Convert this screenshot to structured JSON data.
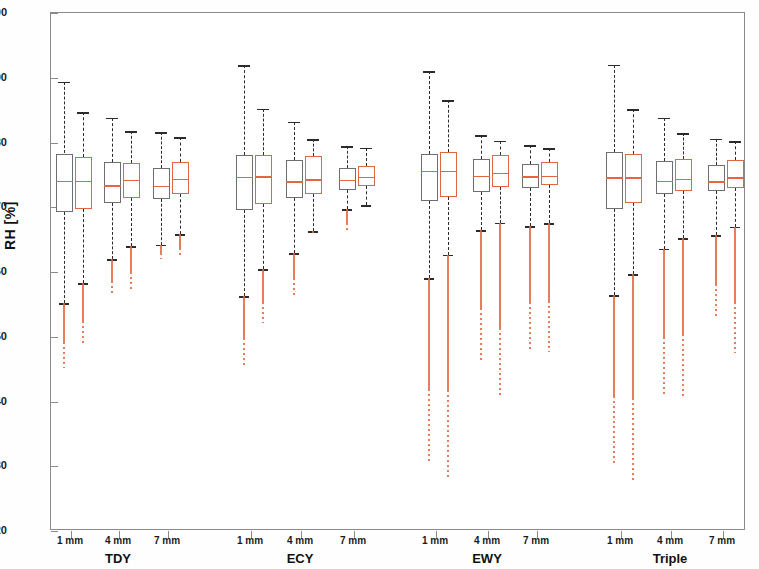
{
  "axes": {
    "ylabel": "RH [%]",
    "ylim": [
      20,
      100
    ],
    "yticks": [
      20,
      30,
      40,
      50,
      60,
      70,
      80,
      90,
      100
    ],
    "ytick_labels": [
      "20",
      "30",
      "40",
      "50",
      "60",
      "70",
      "80",
      "90",
      "100"
    ],
    "grid": false
  },
  "colors": {
    "series_a": "#6b6f73",
    "series_b": "#e2663f",
    "axis": "#8a8a8a",
    "text": "#1a1a1a",
    "background": "#ffffff"
  },
  "groups": [
    {
      "label": "TDY",
      "center": 118
    },
    {
      "label": "ECY",
      "center": 300
    },
    {
      "label": "EWY",
      "center": 487
    },
    {
      "label": "Triple",
      "center": 670
    }
  ],
  "xticks": [
    {
      "label": "1 mm",
      "x": 70
    },
    {
      "label": "4 mm",
      "x": 118
    },
    {
      "label": "7 mm",
      "x": 167
    },
    {
      "label": "1 mm",
      "x": 250
    },
    {
      "label": "4 mm",
      "x": 300
    },
    {
      "label": "7 mm",
      "x": 353
    },
    {
      "label": "1 mm",
      "x": 435
    },
    {
      "label": "4 mm",
      "x": 487
    },
    {
      "label": "7 mm",
      "x": 536
    },
    {
      "label": "1 mm",
      "x": 620
    },
    {
      "label": "4 mm",
      "x": 670
    },
    {
      "label": "7 mm",
      "x": 722
    }
  ],
  "chart_data": {
    "type": "box",
    "title": "",
    "xlabel": "",
    "ylabel": "RH [%]",
    "ylim": [
      20,
      100
    ],
    "yticks": [
      20,
      30,
      40,
      50,
      60,
      70,
      80,
      90,
      100
    ],
    "categories": [
      "TDY 1 mm",
      "TDY 4 mm",
      "TDY 7 mm",
      "ECY 1 mm",
      "ECY 4 mm",
      "ECY 7 mm",
      "EWY 1 mm",
      "EWY 4 mm",
      "EWY 7 mm",
      "Triple 1 mm",
      "Triple 4 mm",
      "Triple 7 mm"
    ],
    "series": [
      {
        "name": "series_a",
        "color": "#6b6f73",
        "style": "gray box, black dashed whiskers",
        "boxes": [
          {
            "category": "TDY 1 mm",
            "x": 63,
            "q1": 69.3,
            "median": 74.1,
            "q3": 78.3,
            "whisker_low": 55.2,
            "whisker_high": 89.4,
            "tail_min": 45.2
          },
          {
            "category": "TDY 4 mm",
            "x": 111,
            "q1": 70.7,
            "median": 73.4,
            "q3": 77.0,
            "whisker_low": 62.0,
            "whisker_high": 83.8,
            "tail_min": 56.4
          },
          {
            "category": "TDY 7 mm",
            "x": 160,
            "q1": 71.3,
            "median": 73.3,
            "q3": 76.1,
            "whisker_low": 64.2,
            "whisker_high": 81.6,
            "tail_min": 62.0
          },
          {
            "category": "ECY 1 mm",
            "x": 243,
            "q1": 69.6,
            "median": 74.7,
            "q3": 78.1,
            "whisker_low": 56.3,
            "whisker_high": 91.9,
            "tail_min": 45.5
          },
          {
            "category": "ECY 4 mm",
            "x": 293,
            "q1": 71.4,
            "median": 74.0,
            "q3": 77.3,
            "whisker_low": 62.9,
            "whisker_high": 83.2,
            "tail_min": 56.4
          },
          {
            "category": "ECY 7 mm",
            "x": 346,
            "q1": 72.7,
            "median": 74.2,
            "q3": 76.0,
            "whisker_low": 69.7,
            "whisker_high": 79.4,
            "tail_min": 66.1
          },
          {
            "category": "EWY 1 mm",
            "x": 428,
            "q1": 70.9,
            "median": 75.6,
            "q3": 78.2,
            "whisker_low": 59.0,
            "whisker_high": 91.0,
            "tail_min": 30.6
          },
          {
            "category": "EWY 4 mm",
            "x": 480,
            "q1": 72.4,
            "median": 74.9,
            "q3": 77.4,
            "whisker_low": 66.5,
            "whisker_high": 81.1,
            "tail_min": 46.3
          },
          {
            "category": "EWY 7 mm",
            "x": 529,
            "q1": 73.0,
            "median": 74.8,
            "q3": 76.7,
            "whisker_low": 67.1,
            "whisker_high": 79.6,
            "tail_min": 47.6
          },
          {
            "category": "Triple 1 mm",
            "x": 613,
            "q1": 69.8,
            "median": 74.6,
            "q3": 78.5,
            "whisker_low": 56.4,
            "whisker_high": 92.0,
            "tail_min": 30.5
          },
          {
            "category": "Triple 4 mm",
            "x": 663,
            "q1": 72.0,
            "median": 74.1,
            "q3": 77.2,
            "whisker_low": 63.6,
            "whisker_high": 83.8,
            "tail_min": 40.8
          },
          {
            "category": "Triple 7 mm",
            "x": 715,
            "q1": 72.5,
            "median": 74.0,
            "q3": 76.6,
            "whisker_low": 65.7,
            "whisker_high": 80.6,
            "tail_min": 53.2
          }
        ]
      },
      {
        "name": "series_b",
        "color": "#e2663f",
        "style": "orange box, black dashed whiskers, orange outlier tail",
        "boxes": [
          {
            "category": "TDY 1 mm",
            "x": 82,
            "q1": 69.7,
            "median": 74.1,
            "q3": 77.7,
            "whisker_low": 58.3,
            "whisker_high": 84.7,
            "tail_min": 48.6
          },
          {
            "category": "TDY 4 mm",
            "x": 130,
            "q1": 71.5,
            "median": 74.2,
            "q3": 76.9,
            "whisker_low": 64.0,
            "whisker_high": 81.7,
            "tail_min": 57.3
          },
          {
            "category": "TDY 7 mm",
            "x": 179,
            "q1": 72.0,
            "median": 74.4,
            "q3": 77.0,
            "whisker_low": 65.8,
            "whisker_high": 80.8,
            "tail_min": 62.4
          },
          {
            "category": "ECY 1 mm",
            "x": 262,
            "q1": 70.5,
            "median": 74.8,
            "q3": 78.1,
            "whisker_low": 60.4,
            "whisker_high": 85.2,
            "tail_min": 52.1
          },
          {
            "category": "ECY 4 mm",
            "x": 312,
            "q1": 72.1,
            "median": 74.3,
            "q3": 77.9,
            "whisker_low": 66.3,
            "whisker_high": 80.5,
            "tail_min": 65.9
          },
          {
            "category": "ECY 7 mm",
            "x": 365,
            "q1": 73.3,
            "median": 74.7,
            "q3": 76.4,
            "whisker_low": 70.3,
            "whisker_high": 79.2,
            "tail_min": 70.3
          },
          {
            "category": "EWY 1 mm",
            "x": 447,
            "q1": 71.6,
            "median": 75.6,
            "q3": 78.6,
            "whisker_low": 62.7,
            "whisker_high": 86.5,
            "tail_min": 27.9
          },
          {
            "category": "EWY 4 mm",
            "x": 499,
            "q1": 73.1,
            "median": 75.3,
            "q3": 78.1,
            "whisker_low": 67.6,
            "whisker_high": 80.3,
            "tail_min": 40.6
          },
          {
            "category": "EWY 7 mm",
            "x": 548,
            "q1": 73.4,
            "median": 74.9,
            "q3": 77.0,
            "whisker_low": 67.5,
            "whisker_high": 79.1,
            "tail_min": 47.6
          },
          {
            "category": "Triple 1 mm",
            "x": 632,
            "q1": 70.6,
            "median": 74.6,
            "q3": 78.2,
            "whisker_low": 59.7,
            "whisker_high": 85.1,
            "tail_min": 27.8
          },
          {
            "category": "Triple 4 mm",
            "x": 682,
            "q1": 72.5,
            "median": 74.4,
            "q3": 77.5,
            "whisker_low": 65.2,
            "whisker_high": 81.4,
            "tail_min": 40.6
          },
          {
            "category": "Triple 7 mm",
            "x": 734,
            "q1": 73.0,
            "median": 74.6,
            "q3": 77.3,
            "whisker_low": 67.0,
            "whisker_high": 80.2,
            "tail_min": 47.5
          }
        ]
      }
    ]
  }
}
